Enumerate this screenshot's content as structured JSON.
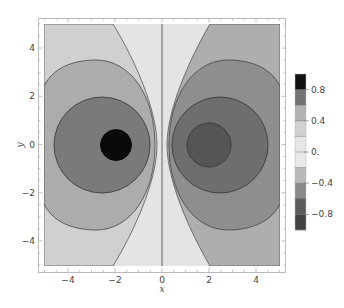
{
  "chart_data": {
    "type": "contour",
    "title": "",
    "xlabel": "x",
    "ylabel": "y",
    "xlim": [
      -5,
      5
    ],
    "ylim": [
      -5,
      5
    ],
    "x_ticks": [
      -4,
      -2,
      0,
      2,
      4
    ],
    "y_ticks": [
      -4,
      -2,
      0,
      2,
      4
    ],
    "x_tick_labels": [
      "−4",
      "−2",
      "0",
      "2",
      "4"
    ],
    "y_tick_labels": [
      "−4",
      "−2",
      "0",
      "2",
      "4"
    ],
    "sources": [
      {
        "x": -2,
        "y": 0,
        "sign": "positive"
      },
      {
        "x": 2,
        "y": 0,
        "sign": "negative"
      }
    ],
    "contour_levels": [
      -0.8,
      -0.6,
      -0.4,
      -0.2,
      0,
      0.2,
      0.4,
      0.6,
      0.8
    ],
    "legend": {
      "position": "right",
      "tick_labels": [
        "0.8",
        "0.4",
        "0.",
        "−0.4",
        "−0.8"
      ],
      "tick_values": [
        0.8,
        0.4,
        0,
        -0.4,
        -0.8
      ],
      "bands": [
        {
          "range": [
            0.8,
            1.0
          ],
          "color": "#111111"
        },
        {
          "range": [
            0.6,
            0.8
          ],
          "color": "#727272"
        },
        {
          "range": [
            0.4,
            0.6
          ],
          "color": "#b2b2b2"
        },
        {
          "range": [
            0.2,
            0.4
          ],
          "color": "#d2d2d2"
        },
        {
          "range": [
            0.0,
            0.2
          ],
          "color": "#e6e6e6"
        },
        {
          "range": [
            -0.2,
            0.0
          ],
          "color": "#e9e9e9"
        },
        {
          "range": [
            -0.4,
            -0.2
          ],
          "color": "#b9b9b9"
        },
        {
          "range": [
            -0.6,
            -0.4
          ],
          "color": "#8a8a8a"
        },
        {
          "range": [
            -0.8,
            -0.6
          ],
          "color": "#5c5c5c"
        },
        {
          "range": [
            -1.0,
            -0.8
          ],
          "color": "#424242"
        }
      ]
    },
    "regions": {
      "left_outer_color": "#d0d0d0",
      "left_ring_color": "#acacac",
      "left_inner_color": "#7a7a7a",
      "left_core_color": "#0a0a0a",
      "center_left_color": "#e4e4e4",
      "center_right_color": "#e8e8e8",
      "right_outer_color": "#aeaeae",
      "right_ring_color": "#8e8e8e",
      "right_inner_color": "#6e6e6e",
      "right_core_color": "#555555"
    }
  }
}
